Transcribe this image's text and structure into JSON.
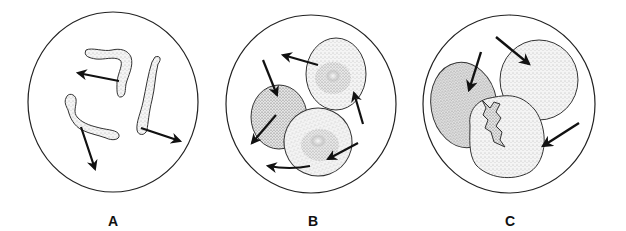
{
  "figure": {
    "type": "microscopy illustration",
    "panels": [
      {
        "label": "A",
        "description": "Three elongated, irregular worm-like cells with arrows showing movement in different directions",
        "cell_count": 3,
        "arrow_count": 3
      },
      {
        "label": "B",
        "description": "Three oval cells with darker stippled centers, arrows around them indicating motion",
        "cell_count": 3,
        "arrow_count": 6
      },
      {
        "label": "C",
        "description": "Three large rounded cells clustered together, one with an irregular torn central region; arrows point inward",
        "cell_count": 3,
        "arrow_count": 3
      }
    ]
  },
  "colors": {
    "background": "#ffffff",
    "outline": "#222222",
    "stipple": "#9a9a9a",
    "arrow": "#111111"
  }
}
